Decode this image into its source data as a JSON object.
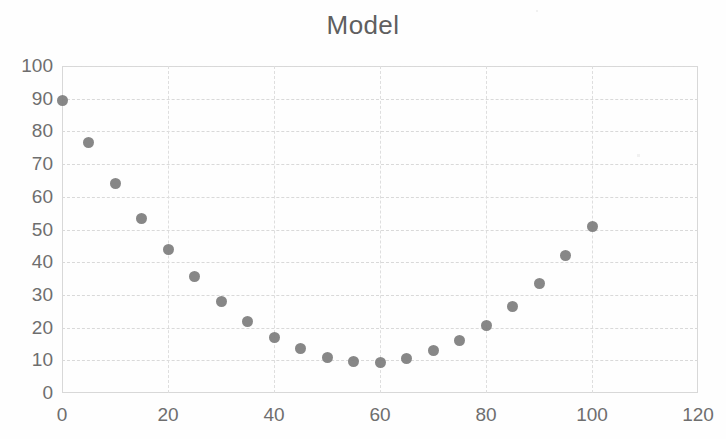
{
  "chart_data": {
    "type": "scatter",
    "title": "Model",
    "xlabel": "",
    "ylabel": "",
    "xlim": [
      0,
      120
    ],
    "ylim": [
      0,
      100
    ],
    "xticks": [
      0,
      20,
      40,
      60,
      80,
      100,
      120
    ],
    "yticks": [
      0,
      10,
      20,
      30,
      40,
      50,
      60,
      70,
      80,
      90,
      100
    ],
    "xtick_labels": [
      "0",
      "20",
      "40",
      "60",
      "80",
      "100",
      "120"
    ],
    "ytick_labels": [
      "0",
      "10",
      "20",
      "30",
      "40",
      "50",
      "60",
      "70",
      "80",
      "90",
      "100"
    ],
    "grid": true,
    "grid_axis": "both",
    "legend": false,
    "legend_position": "none",
    "marker": "circle",
    "marker_color": "#7d7d7d",
    "marker_size": 11,
    "series": [
      {
        "name": "Model",
        "x": [
          0,
          5,
          10,
          15,
          20,
          25,
          30,
          35,
          40,
          45,
          50,
          55,
          60,
          65,
          70,
          75,
          80,
          85,
          90,
          95,
          100
        ],
        "y": [
          89.5,
          76.5,
          64.0,
          53.5,
          44.0,
          35.5,
          28.0,
          22.0,
          17.0,
          13.5,
          11.0,
          9.5,
          9.3,
          10.7,
          13.0,
          16.0,
          20.5,
          26.5,
          33.5,
          42.0,
          51.0
        ]
      }
    ]
  },
  "chart": {
    "title": "Model"
  }
}
